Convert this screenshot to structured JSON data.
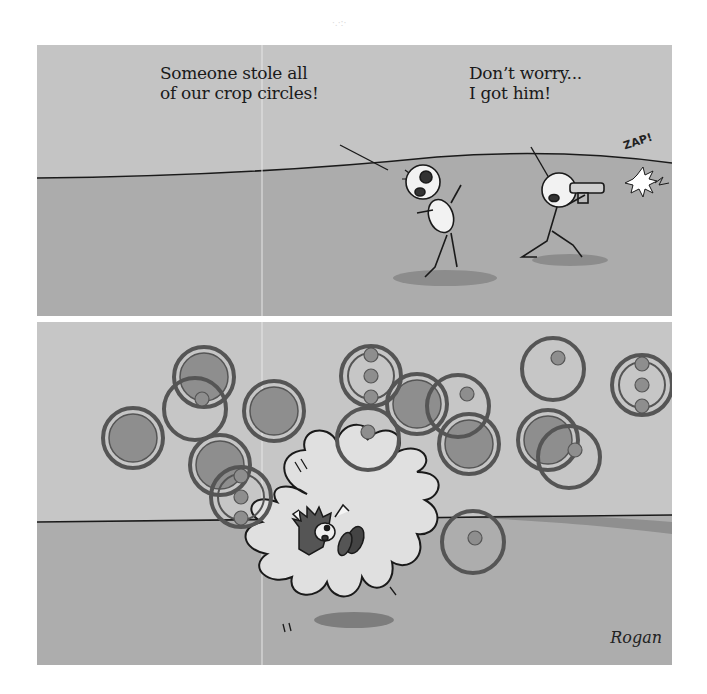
{
  "comic": {
    "panels": [
      {
        "id": "top",
        "dialogue": [
          {
            "speaker": "fleeing-stick-figure",
            "text": "Someone stole all\nof our crop circles!"
          },
          {
            "speaker": "kneeling-stick-figure",
            "text": "Don’t worry...\nI got him!"
          }
        ],
        "sound_effect": "ZAP!"
      },
      {
        "id": "bottom",
        "description": "Crop circles scattered around a burst explosion with a blue hedgehog-like character tumbling"
      }
    ],
    "signature": "Rogan",
    "colors": {
      "sky": "#c4c4c4",
      "ground": "#a9a9a9",
      "circle_fill": "#8e8e8e",
      "circle_stroke": "#555555",
      "burst": "#dedede",
      "ink": "#1a1a1a"
    }
  }
}
